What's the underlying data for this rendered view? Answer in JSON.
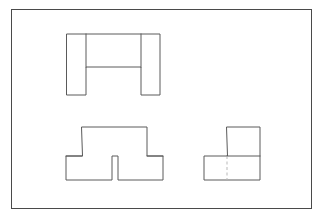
{
  "document": {
    "title": "Orthographic Projection Figures",
    "background_color": "#ffffff"
  },
  "frame": {
    "name": "figure-border",
    "x": 11,
    "y": 9,
    "width": 301,
    "height": 200,
    "stroke_color": "#4a4a4a",
    "stroke_width": 1,
    "fill_color": "#ffffff"
  },
  "style": {
    "visible_edge_color": "#5a5a5a",
    "hidden_edge_color": "#b9b9b9",
    "visible_edge_width": 1,
    "hidden_edge_width": 1,
    "hidden_edge_dash": "3 2.5",
    "shape_fill": "#ffffff"
  },
  "shapes": [
    {
      "name": "shape-top-u-channel",
      "label": "",
      "position": {
        "x": 66,
        "y": 33
      },
      "size": {
        "width": 93,
        "height": 61
      },
      "outline_points": "66,33 159,33 159,94 140,94 140,66 85,66 85,94 66,94",
      "interior_edges": [
        {
          "name": "interior-edge-top-left-vertical",
          "x1": 85,
          "y1": 33,
          "x2": 85,
          "y2": 66
        },
        {
          "name": "interior-edge-top-right-vertical",
          "x1": 140,
          "y1": 33,
          "x2": 140,
          "y2": 66
        }
      ],
      "hidden_edges": []
    },
    {
      "name": "shape-bottom-left-pi",
      "label": "",
      "position": {
        "x": 65,
        "y": 126
      },
      "size": {
        "width": 97,
        "height": 53
      },
      "outline_points": "81,126 146,126 146,155 162,155 162,179 117,179 117,155 111,155 111,179 65,179 65,155 81,155",
      "interior_edges": [
        {
          "name": "interior-edge-left-foot-top",
          "x1": 65,
          "y1": 155,
          "x2": 81,
          "y2": 155
        },
        {
          "name": "interior-edge-right-foot-top",
          "x1": 146,
          "y1": 155,
          "x2": 162,
          "y2": 155
        }
      ],
      "hidden_edges": []
    },
    {
      "name": "shape-bottom-right-l",
      "label": "",
      "position": {
        "x": 203,
        "y": 126
      },
      "size": {
        "width": 56,
        "height": 53
      },
      "outline_points": "226,126 259,126 259,179 203,179 203,155 226,155",
      "interior_edges": [
        {
          "name": "interior-edge-l-horizontal",
          "x1": 226,
          "y1": 155,
          "x2": 259,
          "y2": 155
        }
      ],
      "hidden_edges": [
        {
          "name": "hidden-edge-l-vertical",
          "x1": 226,
          "y1": 155,
          "x2": 226,
          "y2": 179
        }
      ]
    }
  ]
}
